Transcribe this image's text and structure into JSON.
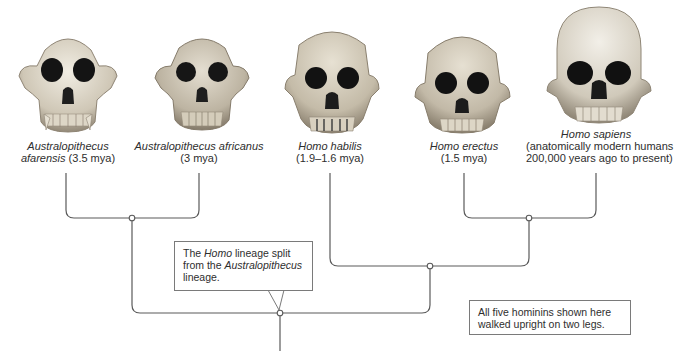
{
  "diagram": {
    "type": "cladogram",
    "taxa": [
      {
        "id": "afarensis",
        "name_italic": "Australopithecus",
        "name_line2_italic": "afarensis",
        "date": "(3.5 mya)",
        "x": 66
      },
      {
        "id": "africanus",
        "name_italic": "Australopithecus africanus",
        "date": "(3 mya)",
        "x": 199
      },
      {
        "id": "habilis",
        "name_italic": "Homo habilis",
        "date": "(1.9–1.6 mya)",
        "x": 330
      },
      {
        "id": "erectus",
        "name_italic": "Homo erectus",
        "date": "(1.5 mya)",
        "x": 464
      },
      {
        "id": "sapiens",
        "name_italic": "Homo sapiens",
        "date_line1": "(anatomically modern humans",
        "date_line2": "200,000 years ago to present)",
        "x": 596
      }
    ],
    "callouts": {
      "split": {
        "pre": "The ",
        "homo": "Homo",
        "mid": " lineage split from the ",
        "australopithecus": "Australopithecus",
        "post": " lineage."
      },
      "bipedal": "All five hominins shown here walked upright on two legs."
    },
    "colors": {
      "line": "#5a5a5a",
      "node_fill": "#ffffff",
      "box_border": "#7a7a7a",
      "bone_light": "#e9e4d8",
      "bone_mid": "#c9c0ae",
      "bone_dark": "#8f8575",
      "orbit": "#141414"
    }
  }
}
